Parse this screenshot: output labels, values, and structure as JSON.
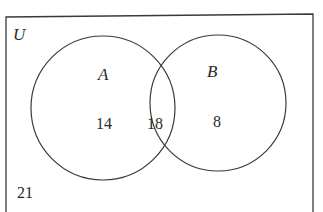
{
  "diagram": {
    "type": "venn",
    "universe_label": "U",
    "sets": [
      {
        "label": "A",
        "only_count": "14"
      },
      {
        "label": "B",
        "only_count": "8"
      }
    ],
    "intersection_count": "18",
    "outside_count": "21"
  },
  "colors": {
    "stroke": "#3a3a3a",
    "text": "#2a2a2a",
    "background": "#ffffff"
  }
}
